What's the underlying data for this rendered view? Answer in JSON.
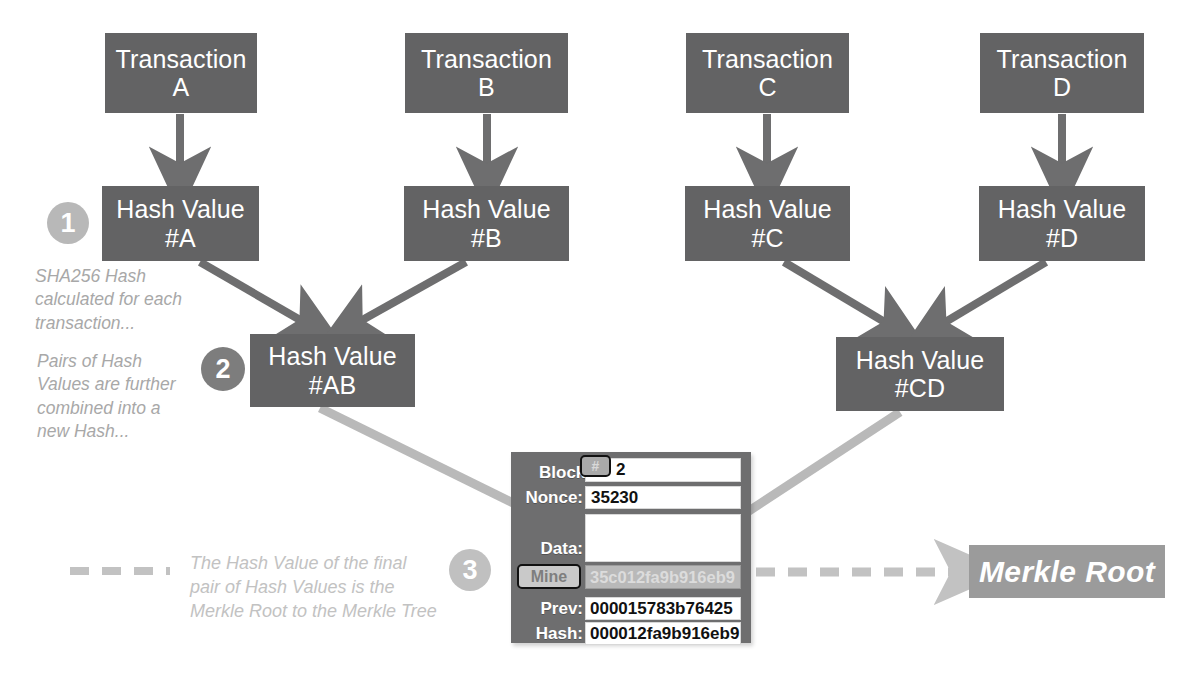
{
  "diagram": {
    "transactions": [
      {
        "line1": "Transaction",
        "line2": "A"
      },
      {
        "line1": "Transaction",
        "line2": "B"
      },
      {
        "line1": "Transaction",
        "line2": "C"
      },
      {
        "line1": "Transaction",
        "line2": "D"
      }
    ],
    "hashes_level1": [
      {
        "line1": "Hash Value",
        "line2": "#A"
      },
      {
        "line1": "Hash Value",
        "line2": "#B"
      },
      {
        "line1": "Hash Value",
        "line2": "#C"
      },
      {
        "line1": "Hash Value",
        "line2": "#D"
      }
    ],
    "hashes_level2": [
      {
        "line1": "Hash Value",
        "line2": "#AB"
      },
      {
        "line1": "Hash Value",
        "line2": "#CD"
      }
    ],
    "steps": [
      {
        "number": "1",
        "caption": "SHA256 Hash\ncalculated for each\ntransaction..."
      },
      {
        "number": "2",
        "caption": "Pairs of Hash\nValues are further\ncombined into a\nnew Hash..."
      },
      {
        "number": "3",
        "caption": "The Hash Value of the final\npair of Hash Values is the\nMerkle Root to the Merkle Tree"
      }
    ],
    "merkle_root_label": "Merkle Root",
    "colors": {
      "node_fill": "#636364",
      "arrow_dark": "#6e6e6f",
      "arrow_light": "#b9b9b9",
      "dashed_arrow": "#c2c2c2",
      "merkle_root_fill": "#9b9b9b",
      "step1_fill": "#b8b8b8",
      "step2_fill": "#7d7d7d",
      "step3_fill": "#c0c0c0",
      "caption_text": "#a8a8a8",
      "panel_fill": "#6e6e6f"
    }
  },
  "block_panel": {
    "block_label": "Block:",
    "hash_symbol_button": "#",
    "block_number": "2",
    "nonce_label": "Nonce:",
    "nonce_value": "35230",
    "data_label": "Data:",
    "data_value": "",
    "mine_button": "Mine",
    "mined_hash_value": "35c012fa9b916eb9",
    "prev_label": "Prev:",
    "prev_value": "000015783b76425",
    "hash_label": "Hash:",
    "hash_value": "000012fa9b916eb9"
  }
}
